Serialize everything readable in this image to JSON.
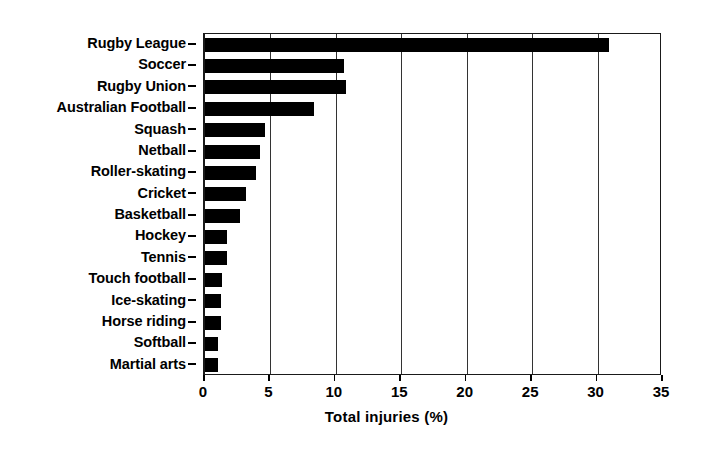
{
  "chart_data": {
    "type": "bar",
    "orientation": "horizontal",
    "title": "",
    "xlabel": "Total injuries (%)",
    "ylabel": "",
    "xlim": [
      0,
      35
    ],
    "xticks": [
      0,
      5,
      10,
      15,
      20,
      25,
      30,
      35
    ],
    "xtick_labels": [
      "0",
      "5",
      "10",
      "15",
      "20",
      "25",
      "30",
      "35"
    ],
    "grid": "vertical",
    "legend": "none",
    "bar_color": "#000000",
    "categories": [
      "Rugby League",
      "Soccer",
      "Rugby Union",
      "Australian Football",
      "Squash",
      "Netball",
      "Roller-skating",
      "Cricket",
      "Basketball",
      "Hockey",
      "Tennis",
      "Touch football",
      "Ice-skating",
      "Horse riding",
      "Softball",
      "Martial arts"
    ],
    "values": [
      30.9,
      10.6,
      10.8,
      8.3,
      4.6,
      4.2,
      3.9,
      3.1,
      2.7,
      1.7,
      1.7,
      1.3,
      1.2,
      1.2,
      1.0,
      1.0
    ]
  }
}
